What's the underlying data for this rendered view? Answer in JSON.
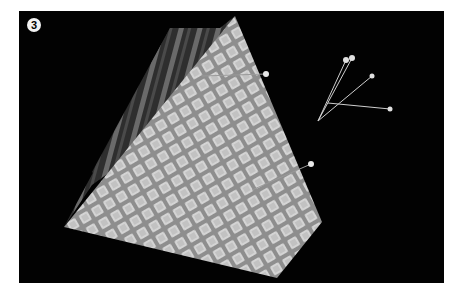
{
  "figure": {
    "step_number": "3",
    "background_color": "#020202",
    "front_face_color": "#b8b8b8",
    "back_face_color": "#3a3a3a",
    "pins": [
      {
        "id": "pin-upper",
        "head": [
          266,
          74
        ],
        "tail": [
          202,
          76
        ]
      },
      {
        "id": "pin-lower",
        "head": [
          311,
          164
        ],
        "tail": [
          252,
          190
        ]
      }
    ],
    "loose_pins": [
      {
        "id": "loose-pin-1",
        "head": [
          346,
          60
        ],
        "tail": [
          318,
          121
        ]
      },
      {
        "id": "loose-pin-2",
        "head": [
          352,
          58
        ],
        "tail": [
          318,
          121
        ]
      },
      {
        "id": "loose-pin-3",
        "head": [
          372,
          76
        ],
        "tail": [
          318,
          121
        ]
      },
      {
        "id": "loose-pin-4",
        "head": [
          390,
          109
        ],
        "tail": [
          328,
          103
        ]
      }
    ]
  }
}
